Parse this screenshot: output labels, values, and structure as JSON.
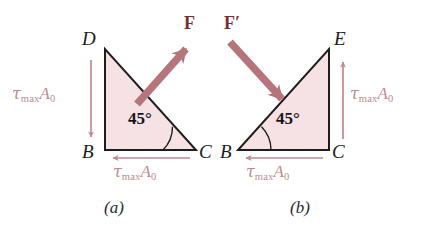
{
  "figure": {
    "background_color": "#ffffff",
    "triangle_fill": "#f7e3e6",
    "triangle_stroke": "#1d1d20",
    "force_arrow_color": "#b5757a",
    "stress_arrow_color": "#c08a90",
    "label_color": "#1b1b1f",
    "force_label_color": "#7a2f33",
    "stress_label_color": "#c08a90"
  },
  "panel_a": {
    "caption": "(a)",
    "vertices": {
      "top_left": "D",
      "bottom_left": "B",
      "bottom_right": "C"
    },
    "angle_label": "45°",
    "angle_at_vertex": "C",
    "force": {
      "label": "F",
      "direction": "up-right"
    },
    "stress_vertical": {
      "tau": "τ",
      "subscript": "max",
      "area": "A",
      "area_subscript": "0",
      "text": "τmaxA0",
      "direction": "down",
      "edge": "DB"
    },
    "stress_horizontal": {
      "tau": "τ",
      "subscript": "max",
      "area": "A",
      "area_subscript": "0",
      "text": "τmaxA0",
      "direction": "left",
      "edge": "BC"
    }
  },
  "panel_b": {
    "caption": "(b)",
    "vertices": {
      "top_right": "E",
      "bottom_left": "B",
      "bottom_right": "C"
    },
    "angle_label": "45°",
    "angle_at_vertex": "B",
    "force": {
      "label": "F′",
      "direction": "down-right"
    },
    "stress_vertical": {
      "tau": "τ",
      "subscript": "max",
      "area": "A",
      "area_subscript": "0",
      "text": "τmaxA0",
      "direction": "up",
      "edge": "CE"
    },
    "stress_horizontal": {
      "tau": "τ",
      "subscript": "max",
      "area": "A",
      "area_subscript": "0",
      "text": "τmaxA0",
      "direction": "left",
      "edge": "BC"
    }
  }
}
